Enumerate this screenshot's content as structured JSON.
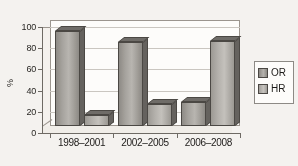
{
  "chart_data": {
    "type": "bar",
    "title": "",
    "subtitle": "",
    "xlabel": "",
    "ylabel": "%",
    "ylim": [
      0,
      100
    ],
    "yticks": [
      0,
      20,
      40,
      60,
      80,
      100
    ],
    "grid": true,
    "legend_position": "right",
    "style": "3d-grouped-bar-grayscale",
    "categories": [
      "1998–2001",
      "2002–2005",
      "2006–2008"
    ],
    "series": [
      {
        "name": "OR",
        "values": [
          90,
          79,
          23
        ],
        "color": "#a5a29d"
      },
      {
        "name": "HR",
        "values": [
          10,
          21,
          80
        ],
        "color": "#c3c0bb"
      }
    ]
  },
  "axis": {
    "y_title": "%",
    "y_tick_labels": [
      "100",
      "80",
      "60",
      "40",
      "20",
      "0"
    ],
    "x_tick_labels": [
      "1998–2001",
      "2002–2005",
      "2006–2008"
    ]
  },
  "legend": {
    "items": [
      {
        "label": "OR",
        "swatch": "legend-swatch-or"
      },
      {
        "label": "HR",
        "swatch": "legend-swatch-hr"
      }
    ]
  },
  "colors": {
    "bar_or": "#a5a29d",
    "bar_hr": "#c3c0bb",
    "bar_outline": "#4c4945",
    "axis": "#6e6a65",
    "gridline": "#c9c5bf",
    "plot_bg": "#fbfaf8",
    "page_bg": "#f4f2ef",
    "text": "#1f1d1b"
  }
}
